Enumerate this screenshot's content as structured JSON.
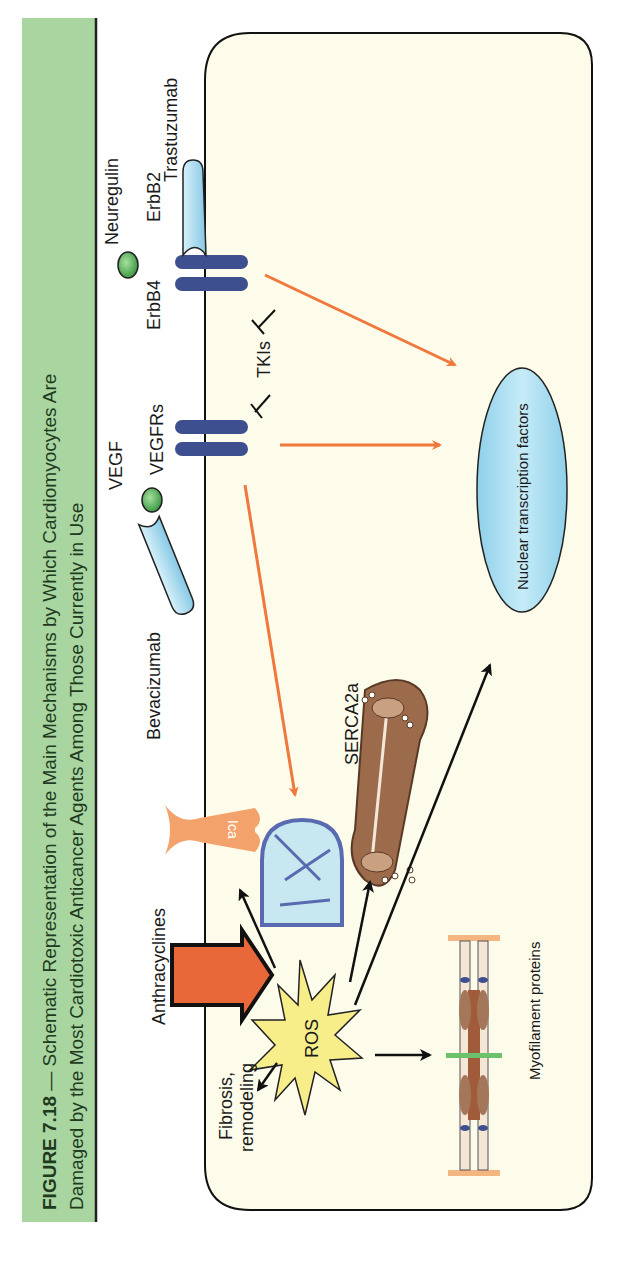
{
  "figure": {
    "title_line1_bold": "FIGURE 7.18",
    "title_line1_rest": " — Schematic Representation of the Main Mechanisms by Which Cardiomyocytes Are",
    "title_line2": "Damaged by the Most Cardiotoxic Anticancer Agents Among Those Currently in Use",
    "title_band_color": "#a8d5a0",
    "cell_fill": "#fdfbea"
  },
  "labels": {
    "neuregulin": "Neuregulin",
    "erbb4": "ErbB4",
    "erbb2": "ErbB2",
    "trastuzumab": "Trastuzumab",
    "tkis": "TKIs",
    "vegf": "VEGF",
    "vegfrs": "VEGFRs",
    "bevacizumab": "Bevacizumab",
    "nucleus": "Nuclear transcription factors",
    "serca": "SERCA2a",
    "ica": "Ica",
    "anthracyclines": "Anthracyclines",
    "ros": "ROS",
    "fibrosis_line1": "Fibrosis,",
    "fibrosis_line2": "remodeling",
    "myofilament": "Myofilament proteins"
  },
  "colors": {
    "receptor": "#3d4f8f",
    "antibody": "#a8d8ec",
    "ligand": "#5cb85c",
    "orange_arrow": "#f0783c",
    "nucleus": "#a9dcef",
    "ros": "#f7ee8a",
    "anthracycline_arrow": "#e8683a",
    "serca": "#9b6b4c",
    "ica": "#f4a26b"
  }
}
